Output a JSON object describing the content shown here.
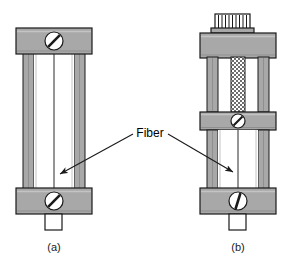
{
  "figure": {
    "kind": "technical-line-drawing",
    "background_color": "#ffffff",
    "metal_fill": "#a8a8a8",
    "metal_shade": "#8f8f8f",
    "outline_color": "#1a1a1a",
    "white_fill": "#ffffff",
    "annotation": {
      "label": "Fiber",
      "arrow_count": 2,
      "arrow_color": "#1a1a1a"
    },
    "panels": [
      {
        "id": "a",
        "caption": "(a)",
        "name": "simple-fiber-holder",
        "parts": [
          {
            "name": "top-clamp-block",
            "screw": true
          },
          {
            "name": "left-post"
          },
          {
            "name": "right-post"
          },
          {
            "name": "fiber-strand"
          },
          {
            "name": "bottom-clamp-block",
            "screw": true
          },
          {
            "name": "bottom-tab"
          }
        ]
      },
      {
        "id": "b",
        "caption": "(b)",
        "name": "adjustable-fiber-holder",
        "parts": [
          {
            "name": "knurled-knob"
          },
          {
            "name": "top-clamp-block"
          },
          {
            "name": "threaded-rod"
          },
          {
            "name": "left-post"
          },
          {
            "name": "right-post"
          },
          {
            "name": "middle-clamp-block",
            "screw": true
          },
          {
            "name": "fiber-strand"
          },
          {
            "name": "bottom-clamp-block",
            "screw": true
          },
          {
            "name": "bottom-tab"
          }
        ]
      }
    ]
  }
}
